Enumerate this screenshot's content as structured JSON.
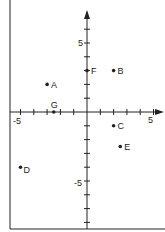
{
  "diagram": {
    "type": "coordinate-plane",
    "xlim": [
      -5,
      5
    ],
    "ylim": [
      -8,
      8
    ],
    "tick_labels": {
      "x_neg": "-5",
      "x_pos": "5",
      "y_pos": "5",
      "y_neg": "-5"
    },
    "points": [
      {
        "label": "A",
        "x": -3,
        "y": 2
      },
      {
        "label": "B",
        "x": 2,
        "y": 3
      },
      {
        "label": "C",
        "x": 2,
        "y": -1
      },
      {
        "label": "D",
        "x": -5,
        "y": -4
      },
      {
        "label": "E",
        "x": 2.5,
        "y": -2.5
      },
      {
        "label": "F",
        "x": 0,
        "y": 3
      },
      {
        "label": "G",
        "x": -2.5,
        "y": 0
      }
    ]
  },
  "colors": {
    "ink": "#222222",
    "background": "#ffffff"
  }
}
